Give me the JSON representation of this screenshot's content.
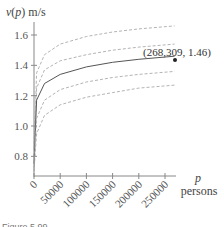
{
  "chart_data": {
    "type": "line",
    "title": "",
    "ylabel": "v(p) m/s",
    "ylabel_var": "v",
    "ylabel_arg": "p",
    "ylabel_unit": "m/s",
    "xlabel": "p",
    "xlabel_unit": "persons",
    "xlim": [
      0,
      270000
    ],
    "ylim": [
      0.7,
      1.7
    ],
    "x_ticks": [
      0,
      50000,
      100000,
      150000,
      200000,
      250000
    ],
    "x_tick_labels": [
      "0",
      "50000",
      "100000",
      "150000",
      "200000",
      "250000"
    ],
    "y_ticks": [
      0.8,
      1.0,
      1.2,
      1.4,
      1.6
    ],
    "y_tick_labels": [
      "0.8",
      "1.0",
      "1.2",
      "1.4",
      "1.6"
    ],
    "grid": false,
    "legend": null,
    "series": [
      {
        "name": "upper bound 2",
        "style": "dashed",
        "x": [
          0,
          5000,
          20000,
          50000,
          100000,
          150000,
          200000,
          268309
        ],
        "values": [
          0.85,
          1.35,
          1.47,
          1.54,
          1.59,
          1.62,
          1.64,
          1.66
        ]
      },
      {
        "name": "upper bound 1",
        "style": "dashed",
        "x": [
          0,
          5000,
          20000,
          50000,
          100000,
          150000,
          200000,
          268309
        ],
        "values": [
          0.8,
          1.25,
          1.37,
          1.43,
          1.47,
          1.5,
          1.52,
          1.54
        ]
      },
      {
        "name": "v(p)",
        "style": "solid",
        "x": [
          0,
          5000,
          20000,
          50000,
          100000,
          150000,
          200000,
          268309
        ],
        "values": [
          0.75,
          1.17,
          1.28,
          1.34,
          1.39,
          1.42,
          1.44,
          1.46
        ]
      },
      {
        "name": "lower bound 1",
        "style": "dashed",
        "x": [
          0,
          5000,
          20000,
          50000,
          100000,
          150000,
          200000,
          268309
        ],
        "values": [
          0.72,
          1.05,
          1.17,
          1.24,
          1.29,
          1.32,
          1.34,
          1.36
        ]
      },
      {
        "name": "lower bound 2",
        "style": "dashed",
        "x": [
          0,
          5000,
          20000,
          50000,
          100000,
          150000,
          200000,
          268309
        ],
        "values": [
          0.7,
          0.95,
          1.07,
          1.14,
          1.19,
          1.22,
          1.25,
          1.27
        ]
      }
    ],
    "annotations": [
      {
        "text": "(268,309, 1.46)",
        "x": 268309,
        "y": 1.46,
        "marker": "dot"
      }
    ]
  },
  "caption": "Figure 5.99"
}
